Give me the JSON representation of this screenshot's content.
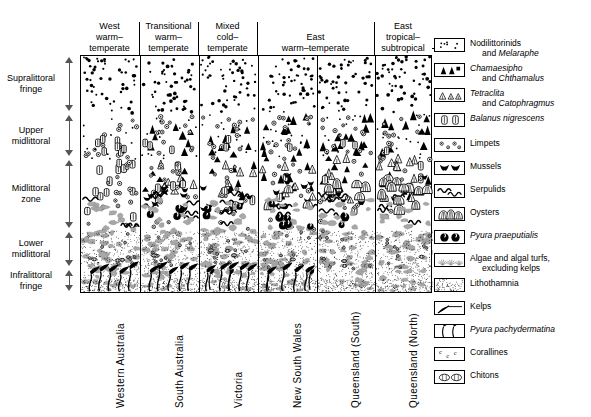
{
  "diagram": {
    "type": "zonation-profile"
  },
  "zones": [
    {
      "line1": "Supralittoral",
      "line2": "fringe",
      "top": 0,
      "height": 58
    },
    {
      "line1": "Upper",
      "line2": "midlittoral",
      "top": 58,
      "height": 45
    },
    {
      "line1": "Midlittoral",
      "line2": "zone",
      "top": 103,
      "height": 72
    },
    {
      "line1": "Lower",
      "line2": "midlittoral",
      "top": 175,
      "height": 38
    },
    {
      "line1": "Infralittoral",
      "line2": "fringe",
      "top": 213,
      "height": 25
    }
  ],
  "header_groups": [
    {
      "lines": [
        "West",
        "warm–",
        "temperate"
      ],
      "left": 0,
      "width": 59
    },
    {
      "lines": [
        "Transitional",
        "warm–",
        "temperate"
      ],
      "left": 59,
      "width": 59
    },
    {
      "lines": [
        "Mixed",
        "cold–",
        "temperate"
      ],
      "left": 118,
      "width": 59
    },
    {
      "lines": [
        "East",
        "warm–temperate"
      ],
      "left": 177,
      "width": 117
    },
    {
      "lines": [
        "East",
        "tropical–subtropical"
      ],
      "left": 294,
      "width": 58
    }
  ],
  "header_rules": [
    59,
    118,
    177,
    294
  ],
  "columns": [
    {
      "label": "Western Australia",
      "left": 0,
      "width": 59
    },
    {
      "label": "South Australia",
      "left": 59,
      "width": 59
    },
    {
      "label": "Victoria",
      "left": 118,
      "width": 59
    },
    {
      "label": "New South Wales",
      "left": 177,
      "width": 59
    },
    {
      "label": "Queensland (South)",
      "left": 236,
      "width": 58
    },
    {
      "label": "Queensland (North)",
      "left": 294,
      "width": 58
    }
  ],
  "legend": [
    {
      "icon": "nodilittorinids-icon",
      "line1": "Nodilittorinids",
      "line2": "and Melaraphe",
      "line2_italic_from": 4,
      "top": 0
    },
    {
      "icon": "chamaesipho-icon",
      "line1": "Chamaesipho",
      "line2": "and Chthamalus",
      "line1_italic": true,
      "line2_italic_from": 4,
      "top": 25
    },
    {
      "icon": "tetraclita-icon",
      "line1": "Tetraclita",
      "line2": "and Catophragmus",
      "line1_italic": true,
      "line2_italic_from": 4,
      "top": 50
    },
    {
      "icon": "balanus-icon",
      "line1": "Balanus nigrescens",
      "line2": "",
      "line1_italic": true,
      "top": 75
    },
    {
      "icon": "limpets-icon",
      "line1": "Limpets",
      "line2": "",
      "top": 100
    },
    {
      "icon": "mussels-icon",
      "line1": "Mussels",
      "line2": "",
      "top": 123
    },
    {
      "icon": "serpulids-icon",
      "line1": "Serpulids",
      "line2": "",
      "top": 146
    },
    {
      "icon": "oysters-icon",
      "line1": "Oysters",
      "line2": "",
      "top": 169
    },
    {
      "icon": "pyura-praeputialis-icon",
      "line1": "Pyura praeputialis",
      "line2": "",
      "line1_italic": true,
      "top": 192
    },
    {
      "icon": "algae-icon",
      "line1": "Algae and algal turfs,",
      "line2": "excluding kelps",
      "top": 215
    },
    {
      "icon": "lithothamnia-icon",
      "line1": "Lithothamnia",
      "line2": "",
      "top": 240
    },
    {
      "icon": "kelps-icon",
      "line1": "Kelps",
      "line2": "",
      "top": 263
    },
    {
      "icon": "pyura-pachydermatina-icon",
      "line1": "Pyura pachydermatina",
      "line2": "",
      "line1_italic": true,
      "top": 286
    },
    {
      "icon": "corallines-icon",
      "line1": "Corallines",
      "line2": "",
      "top": 309
    },
    {
      "icon": "chitons-icon",
      "line1": "Chitons",
      "line2": "",
      "top": 332
    }
  ],
  "colors": {
    "ink": "#000000",
    "arrow": "#555555",
    "background": "#ffffff",
    "shade": "#9a9a9a"
  }
}
